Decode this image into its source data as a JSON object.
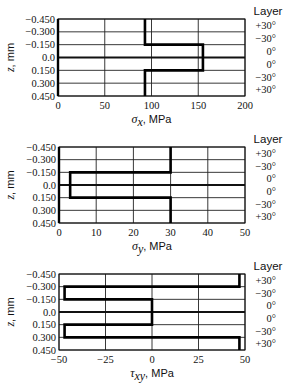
{
  "chart_data": [
    {
      "type": "line",
      "title": "",
      "xlabel_symbol": "σ",
      "xlabel_sub": "x",
      "xlabel_unit": ", MPa",
      "ylabel_symbol": "z",
      "ylabel_unit": ", mm",
      "xlim": [
        0,
        200
      ],
      "xticks": [
        0,
        50,
        100,
        150,
        200
      ],
      "yticks": [
        "-0.450",
        "-0.300",
        "-0.150",
        "0.0",
        "0.150",
        "0.300",
        "0.450"
      ],
      "ylim": [
        -0.45,
        0.45
      ],
      "layer_header": "Layer",
      "layers": [
        "+30°",
        "−30°",
        "0°",
        "0°",
        "−30°",
        "+30°"
      ],
      "grid": true,
      "series": [
        {
          "name": "sigma_x",
          "z_intervals": [
            [
              -0.45,
              -0.3
            ],
            [
              -0.3,
              -0.15
            ],
            [
              -0.15,
              0.0
            ],
            [
              0.0,
              0.15
            ],
            [
              0.15,
              0.3
            ],
            [
              0.3,
              0.45
            ]
          ],
          "values": [
            93,
            93,
            155,
            155,
            93,
            93
          ]
        }
      ]
    },
    {
      "type": "line",
      "title": "",
      "xlabel_symbol": "σ",
      "xlabel_sub": "y",
      "xlabel_unit": ", MPa",
      "ylabel_symbol": "z",
      "ylabel_unit": ", mm",
      "xlim": [
        0,
        50
      ],
      "xticks": [
        0,
        10,
        20,
        30,
        40,
        50
      ],
      "yticks": [
        "-0.450",
        "-0.300",
        "-0.150",
        "0.0",
        "0.150",
        "0.300",
        "0.450"
      ],
      "ylim": [
        -0.45,
        0.45
      ],
      "layer_header": "Layer",
      "layers": [
        "+30°",
        "−30°",
        "0°",
        "0°",
        "−30°",
        "+30°"
      ],
      "grid": true,
      "series": [
        {
          "name": "sigma_y",
          "z_intervals": [
            [
              -0.45,
              -0.3
            ],
            [
              -0.3,
              -0.15
            ],
            [
              -0.15,
              0.0
            ],
            [
              0.0,
              0.15
            ],
            [
              0.15,
              0.3
            ],
            [
              0.3,
              0.45
            ]
          ],
          "values": [
            30,
            30,
            3,
            3,
            30,
            30
          ]
        }
      ]
    },
    {
      "type": "line",
      "title": "",
      "xlabel_symbol": "τ",
      "xlabel_sub": "xy",
      "xlabel_unit": ", MPa",
      "ylabel_symbol": "z",
      "ylabel_unit": ", mm",
      "xlim": [
        -50,
        50
      ],
      "xticks": [
        -50,
        -25,
        0,
        25,
        50
      ],
      "yticks": [
        "-0.450",
        "-0.300",
        "-0.150",
        "0.0",
        "0.150",
        "0.300",
        "0.450"
      ],
      "ylim": [
        -0.45,
        0.45
      ],
      "layer_header": "Layer",
      "layers": [
        "+30°",
        "−30°",
        "0°",
        "0°",
        "−30°",
        "+30°"
      ],
      "grid": true,
      "series": [
        {
          "name": "tau_xy",
          "z_intervals": [
            [
              -0.45,
              -0.3
            ],
            [
              -0.3,
              -0.15
            ],
            [
              -0.15,
              0.0
            ],
            [
              0.0,
              0.15
            ],
            [
              0.15,
              0.3
            ],
            [
              0.3,
              0.45
            ]
          ],
          "values": [
            47,
            -47,
            0,
            0,
            -47,
            47
          ]
        }
      ]
    }
  ]
}
